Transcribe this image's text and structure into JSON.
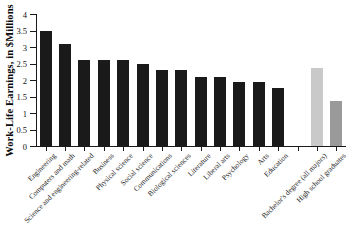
{
  "chart_data": {
    "type": "bar",
    "title": "",
    "xlabel": "",
    "ylabel": "Work-Life Earnings, in $Millions",
    "ylim": [
      0,
      4
    ],
    "ytick_labels": [
      "0",
      "0.5",
      "1",
      "1.5",
      "2",
      "2.5",
      "3",
      "3.5",
      "4"
    ],
    "ytick_values": [
      0,
      0.5,
      1,
      1.5,
      2,
      2.5,
      3,
      3.5,
      4
    ],
    "grid": false,
    "legend": "none",
    "categories": [
      "Engineering",
      "Computers and math",
      "Science and engineering-related",
      "Business",
      "Physical science",
      "Social science",
      "Communications",
      "Biological sciences",
      "Literature",
      "Liberal arts",
      "Psychology",
      "Arts",
      "Education",
      "",
      "Bachelor's degree (all majors)",
      "High school graduates"
    ],
    "values": [
      3.5,
      3.1,
      2.6,
      2.6,
      2.6,
      2.5,
      2.3,
      2.3,
      2.1,
      2.1,
      1.95,
      1.95,
      1.75,
      null,
      2.35,
      1.35
    ],
    "bar_colors": [
      "#1a1a1a",
      "#1a1a1a",
      "#1a1a1a",
      "#1a1a1a",
      "#1a1a1a",
      "#1a1a1a",
      "#1a1a1a",
      "#1a1a1a",
      "#1a1a1a",
      "#1a1a1a",
      "#1a1a1a",
      "#1a1a1a",
      "#1a1a1a",
      "#ffffff",
      "#c9c9c9",
      "#9a9a9a"
    ],
    "colors": {
      "major_bar": "#1a1a1a",
      "benchmark_bachelors": "#c9c9c9",
      "benchmark_highschool": "#9a9a9a",
      "axis": "#1a1a1a",
      "background": "#ffffff"
    }
  }
}
